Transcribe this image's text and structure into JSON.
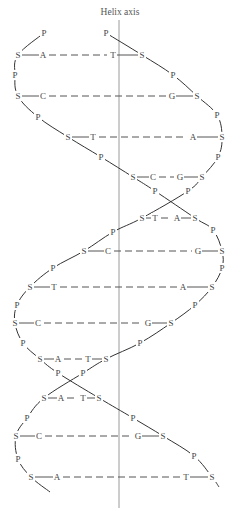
{
  "title": "Helix axis",
  "colors": {
    "line": "#333333",
    "axis": "#9a9a9a",
    "text": "#444444",
    "background": "#ffffff"
  },
  "axis": {
    "x": 119,
    "y1": 20,
    "y2": 508,
    "label_y": 12
  },
  "legend": {
    "S": "sugar (deoxyribose)",
    "P": "phosphate",
    "A": "adenine",
    "T": "thymine",
    "C": "cytosine",
    "G": "guanine"
  },
  "base_pairs": [
    {
      "y": 55,
      "left_sugar_x": 18,
      "left_base": "A",
      "left_base_x": 43,
      "right_base": "T",
      "right_base_x": 113,
      "right_sugar_x": 142
    },
    {
      "y": 96,
      "left_sugar_x": 18,
      "left_base": "C",
      "left_base_x": 43,
      "right_base": "G",
      "right_base_x": 172,
      "right_sugar_x": 197
    },
    {
      "y": 137,
      "left_sugar_x": 68,
      "left_base": "T",
      "left_base_x": 93,
      "right_base": "A",
      "right_base_x": 193,
      "right_sugar_x": 222
    },
    {
      "y": 177,
      "left_sugar_x": 133,
      "left_base": "C",
      "left_base_x": 153,
      "right_base": "G",
      "right_base_x": 180,
      "right_sugar_x": 202
    },
    {
      "y": 218,
      "left_sugar_x": 142,
      "left_base": "T",
      "left_base_x": 155,
      "right_base": "A",
      "right_base_x": 177,
      "right_sugar_x": 195
    },
    {
      "y": 251,
      "left_sugar_x": 84,
      "left_base": "C",
      "left_base_x": 108,
      "right_base": "G",
      "right_base_x": 198,
      "right_sugar_x": 222
    },
    {
      "y": 287,
      "left_sugar_x": 30,
      "left_base": "T",
      "left_base_x": 54,
      "right_base": "A",
      "right_base_x": 183,
      "right_sugar_x": 212
    },
    {
      "y": 323,
      "left_sugar_x": 15,
      "left_base": "C",
      "left_base_x": 38,
      "right_base": "G",
      "right_base_x": 148,
      "right_sugar_x": 171
    },
    {
      "y": 359,
      "left_sugar_x": 40,
      "left_base": "A",
      "left_base_x": 58,
      "right_base": "T",
      "right_base_x": 88,
      "right_sugar_x": 106
    },
    {
      "y": 398,
      "left_sugar_x": 44,
      "left_base": "A",
      "left_base_x": 61,
      "right_base": "T",
      "right_base_x": 83,
      "right_sugar_x": 99
    },
    {
      "y": 436,
      "left_sugar_x": 16,
      "left_base": "C",
      "left_base_x": 39,
      "right_base": "G",
      "right_base_x": 138,
      "right_sugar_x": 163
    },
    {
      "y": 477,
      "left_sugar_x": 31,
      "left_base": "A",
      "left_base_x": 57,
      "right_base": "T",
      "right_base_x": 186,
      "right_sugar_x": 212
    }
  ],
  "strand_1": {
    "description": "Backbone running from top-left P, down left side, crossing to right",
    "nodes": [
      {
        "t": "P",
        "x": 44,
        "y": 33
      },
      {
        "t": "S",
        "x": 18,
        "y": 55
      },
      {
        "t": "P",
        "x": 15,
        "y": 75
      },
      {
        "t": "S",
        "x": 18,
        "y": 96
      },
      {
        "t": "P",
        "x": 38,
        "y": 117
      },
      {
        "t": "S",
        "x": 68,
        "y": 137
      },
      {
        "t": "P",
        "x": 101,
        "y": 157
      },
      {
        "t": "S",
        "x": 133,
        "y": 177
      },
      {
        "t": "P",
        "x": 155,
        "y": 191
      },
      {
        "t": "S",
        "x": 195,
        "y": 218
      },
      {
        "t": "P",
        "x": 213,
        "y": 230
      },
      {
        "t": "S",
        "x": 222,
        "y": 251
      },
      {
        "t": "P",
        "x": 222,
        "y": 268
      },
      {
        "t": "S",
        "x": 212,
        "y": 287
      },
      {
        "t": "P",
        "x": 195,
        "y": 305
      },
      {
        "t": "S",
        "x": 171,
        "y": 323
      },
      {
        "t": "P",
        "x": 140,
        "y": 343
      },
      {
        "t": "S",
        "x": 106,
        "y": 359
      },
      {
        "t": "P",
        "x": 83,
        "y": 373
      },
      {
        "t": "S",
        "x": 44,
        "y": 398
      },
      {
        "t": "P",
        "x": 27,
        "y": 418
      },
      {
        "t": "S",
        "x": 16,
        "y": 436
      },
      {
        "t": "P",
        "x": 18,
        "y": 459
      },
      {
        "t": "S",
        "x": 31,
        "y": 477
      }
    ],
    "tail_end": {
      "x": 50,
      "y": 492
    }
  },
  "strand_2": {
    "description": "Backbone running from top P near axis, down right side, crossing to left",
    "nodes": [
      {
        "t": "P",
        "x": 106,
        "y": 33
      },
      {
        "t": "S",
        "x": 142,
        "y": 55
      },
      {
        "t": "P",
        "x": 173,
        "y": 75
      },
      {
        "t": "S",
        "x": 197,
        "y": 96
      },
      {
        "t": "P",
        "x": 217,
        "y": 115
      },
      {
        "t": "S",
        "x": 222,
        "y": 137
      },
      {
        "t": "P",
        "x": 218,
        "y": 157
      },
      {
        "t": "S",
        "x": 202,
        "y": 177
      },
      {
        "t": "P",
        "x": 188,
        "y": 191
      },
      {
        "t": "S",
        "x": 142,
        "y": 218
      },
      {
        "t": "P",
        "x": 113,
        "y": 232
      },
      {
        "t": "S",
        "x": 84,
        "y": 251
      },
      {
        "t": "P",
        "x": 53,
        "y": 268
      },
      {
        "t": "S",
        "x": 30,
        "y": 287
      },
      {
        "t": "P",
        "x": 17,
        "y": 305
      },
      {
        "t": "S",
        "x": 15,
        "y": 323
      },
      {
        "t": "P",
        "x": 23,
        "y": 343
      },
      {
        "t": "S",
        "x": 40,
        "y": 359
      },
      {
        "t": "P",
        "x": 58,
        "y": 373
      },
      {
        "t": "S",
        "x": 99,
        "y": 398
      },
      {
        "t": "P",
        "x": 133,
        "y": 418
      },
      {
        "t": "S",
        "x": 163,
        "y": 436
      },
      {
        "t": "P",
        "x": 194,
        "y": 456
      },
      {
        "t": "S",
        "x": 212,
        "y": 477
      }
    ],
    "tail_end": {
      "x": 219,
      "y": 487
    }
  }
}
